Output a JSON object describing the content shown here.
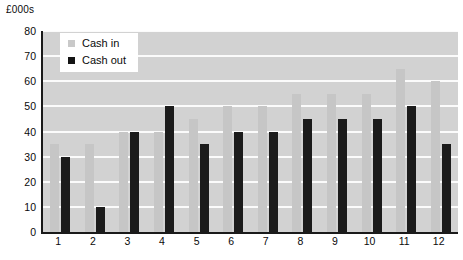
{
  "axis": {
    "unit_label": "£000s",
    "y_ticks": [
      0,
      10,
      20,
      30,
      40,
      50,
      60,
      70,
      80
    ],
    "x_ticks": [
      "1",
      "2",
      "3",
      "4",
      "5",
      "6",
      "7",
      "8",
      "9",
      "10",
      "11",
      "12"
    ]
  },
  "legend": {
    "position": "top-left-inside",
    "items": [
      {
        "label": "Cash in",
        "color": "#c9c9c9",
        "swatch": "square-swatch-icon"
      },
      {
        "label": "Cash out",
        "color": "#141414",
        "swatch": "square-swatch-icon"
      }
    ]
  },
  "colors": {
    "cash_in": "#c6c6c6",
    "cash_out": "#1b1b1b",
    "plot_background": "#d2d2d2",
    "gridline": "#fbfbfb",
    "axis": "#1a1a1a",
    "text": "#0a0a0a"
  },
  "chart_data": {
    "type": "bar",
    "title": "",
    "subtitle": "",
    "xlabel": "",
    "ylabel": "£000s",
    "ylim": [
      0,
      80
    ],
    "y_tick_step": 10,
    "grid": true,
    "legend_position": "top-left-inside",
    "categories": [
      "1",
      "2",
      "3",
      "4",
      "5",
      "6",
      "7",
      "8",
      "9",
      "10",
      "11",
      "12"
    ],
    "series": [
      {
        "name": "Cash in",
        "color": "#c6c6c6",
        "values": [
          35,
          35,
          40,
          40,
          45,
          50,
          50,
          55,
          55,
          55,
          65,
          60
        ]
      },
      {
        "name": "Cash out",
        "color": "#1b1b1b",
        "values": [
          30,
          10,
          40,
          50,
          35,
          40,
          40,
          45,
          45,
          45,
          50,
          35
        ]
      }
    ]
  }
}
